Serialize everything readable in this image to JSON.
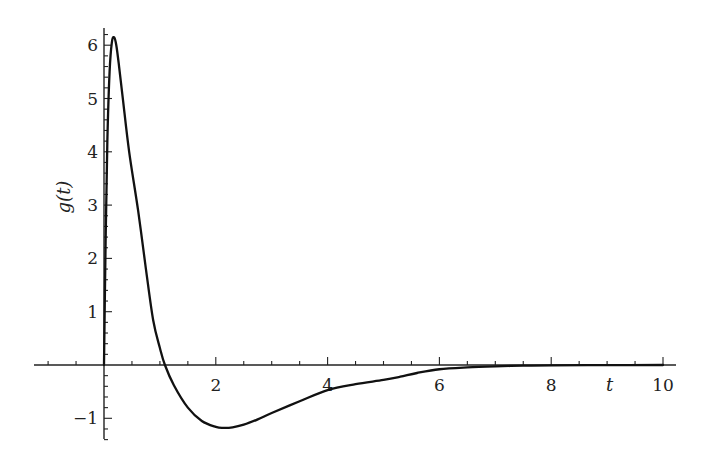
{
  "chart_data": {
    "type": "line",
    "title": "",
    "xlabel": "t",
    "ylabel": "g(t)",
    "xlim": [
      -1.25,
      10.25
    ],
    "ylim": [
      -1.4,
      6.3
    ],
    "grid": false,
    "legend": null,
    "x_ticks": [
      2,
      4,
      6,
      8,
      10
    ],
    "x_tick_labels": [
      "2",
      "4",
      "6",
      "8",
      "10"
    ],
    "y_ticks": [
      -1,
      1,
      2,
      3,
      4,
      5,
      6
    ],
    "y_tick_labels": [
      "−1",
      "1",
      "2",
      "3",
      "4",
      "5",
      "6"
    ],
    "x_minor_step": 0.5,
    "y_minor_step": 0.2,
    "series": [
      {
        "name": "g(t)",
        "color": "#111111",
        "x": [
          0,
          0.03,
          0.06,
          0.1,
          0.14,
          0.18,
          0.22,
          0.27,
          0.34,
          0.45,
          0.61,
          0.75,
          0.88,
          1.0,
          1.09,
          1.25,
          1.5,
          1.75,
          2.0,
          2.13,
          2.3,
          2.5,
          2.75,
          3.0,
          3.5,
          4.0,
          4.5,
          5.0,
          5.3,
          5.6,
          6.0,
          6.5,
          7.0,
          7.5,
          8.0,
          9.0,
          10.0
        ],
        "y": [
          0,
          2.4,
          4.2,
          5.5,
          6.05,
          6.15,
          6.0,
          5.6,
          4.97,
          4.0,
          2.9,
          1.8,
          0.84,
          0.32,
          0.0,
          -0.38,
          -0.8,
          -1.05,
          -1.16,
          -1.18,
          -1.17,
          -1.12,
          -1.02,
          -0.9,
          -0.68,
          -0.47,
          -0.36,
          -0.28,
          -0.22,
          -0.15,
          -0.08,
          -0.045,
          -0.025,
          -0.013,
          -0.006,
          -0.002,
          0.0
        ]
      }
    ]
  }
}
